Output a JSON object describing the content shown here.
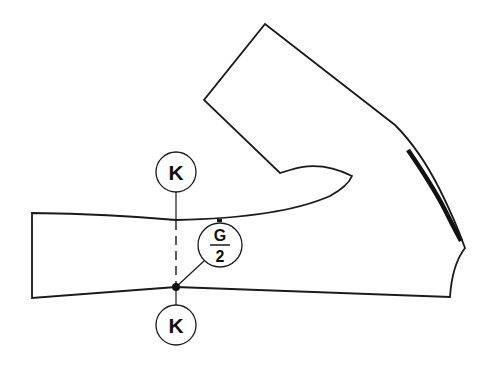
{
  "diagram": {
    "labels": {
      "top_circle": "K",
      "bottom_circle": "K",
      "fraction_numerator": "G",
      "fraction_denominator": "2"
    },
    "colors": {
      "stroke": "#1a1a1a",
      "background": "#ffffff"
    }
  }
}
